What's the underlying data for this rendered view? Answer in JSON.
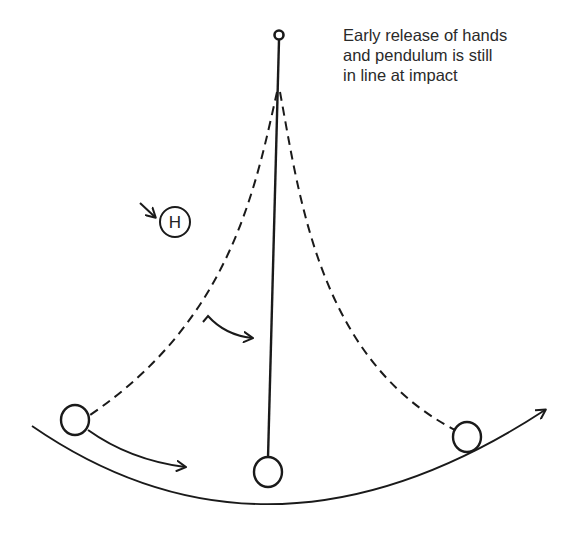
{
  "caption": {
    "lines": [
      "Early release of hands",
      "and pendulum is still",
      "in line at impact"
    ]
  },
  "hand_marker": {
    "label": "H"
  },
  "colors": {
    "ink": "#1a1a1a",
    "background": "#ffffff"
  }
}
